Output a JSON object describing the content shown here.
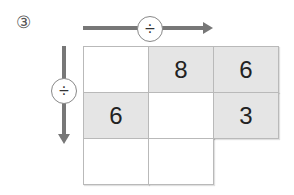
{
  "problem": {
    "number_label": "③",
    "horizontal_operator": "÷",
    "vertical_operator": "÷"
  },
  "grid": {
    "rows": [
      [
        "",
        "8",
        "6"
      ],
      [
        "6",
        "",
        "3"
      ],
      [
        "",
        "",
        null
      ]
    ],
    "shaded": [
      [
        false,
        true,
        true
      ],
      [
        true,
        false,
        true
      ],
      [
        false,
        false,
        null
      ]
    ]
  }
}
